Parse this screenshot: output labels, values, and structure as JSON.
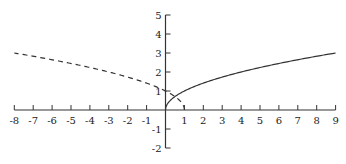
{
  "chart_data": {
    "type": "line",
    "title": "",
    "xlabel": "",
    "ylabel": "",
    "xlim": [
      -8,
      9
    ],
    "ylim": [
      -2,
      5
    ],
    "grid": false,
    "legend": null,
    "x_ticks": [
      -8,
      -7,
      -6,
      -5,
      -4,
      -3,
      -2,
      -1,
      1,
      2,
      3,
      4,
      5,
      6,
      7,
      8,
      9
    ],
    "y_ticks": [
      -2,
      -1,
      1,
      2,
      3,
      4,
      5
    ],
    "series": [
      {
        "name": "y = sqrt(x)",
        "style": "solid",
        "color": "#333333",
        "x": [
          0,
          0.25,
          1,
          2,
          3,
          4,
          5,
          6,
          7,
          8,
          9
        ],
        "y": [
          0,
          0.5,
          1,
          1.41,
          1.73,
          2,
          2.24,
          2.45,
          2.65,
          2.83,
          3
        ]
      },
      {
        "name": "y = sqrt(1 - x)",
        "style": "dashed",
        "color": "#333333",
        "x": [
          -8,
          -7,
          -6,
          -5,
          -4,
          -3,
          -2,
          -1,
          0,
          0.5,
          0.9,
          1
        ],
        "y": [
          3,
          2.83,
          2.65,
          2.45,
          2.24,
          2,
          1.73,
          1.41,
          1,
          0.71,
          0.32,
          0
        ]
      }
    ]
  }
}
